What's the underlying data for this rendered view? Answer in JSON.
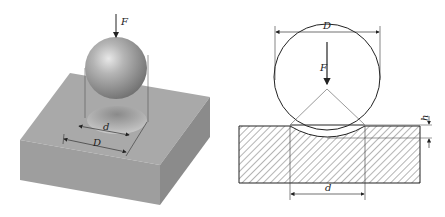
{
  "figure": {
    "left_panel": {
      "description": "3D view of spherical indenter pressed into block",
      "labels": {
        "force": "F",
        "indent_diameter": "d",
        "ball_diameter": "D"
      }
    },
    "right_panel": {
      "description": "Cross-section of ball indenter and specimen",
      "labels": {
        "ball_diameter": "D",
        "force": "F",
        "depth": "h",
        "indent_diameter": "d"
      }
    },
    "colors": {
      "block_top": "#a8a8a8",
      "block_front": "#9c9c9c",
      "block_side": "#8a8a8a",
      "sphere": "#b0b0b0",
      "line": "#333333"
    }
  }
}
